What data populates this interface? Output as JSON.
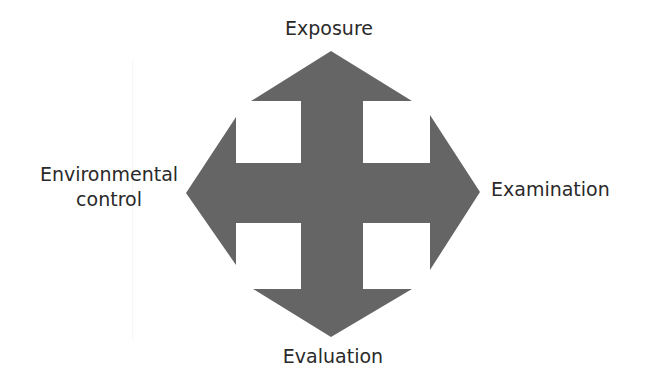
{
  "diagram": {
    "type": "four-way-arrow",
    "fill_color": "#656565",
    "text_color": "#2a2a2a",
    "labels": {
      "top": "Exposure",
      "right": "Examination",
      "bottom": "Evaluation",
      "left_line1": "Environmental",
      "left_line2": "control"
    }
  }
}
